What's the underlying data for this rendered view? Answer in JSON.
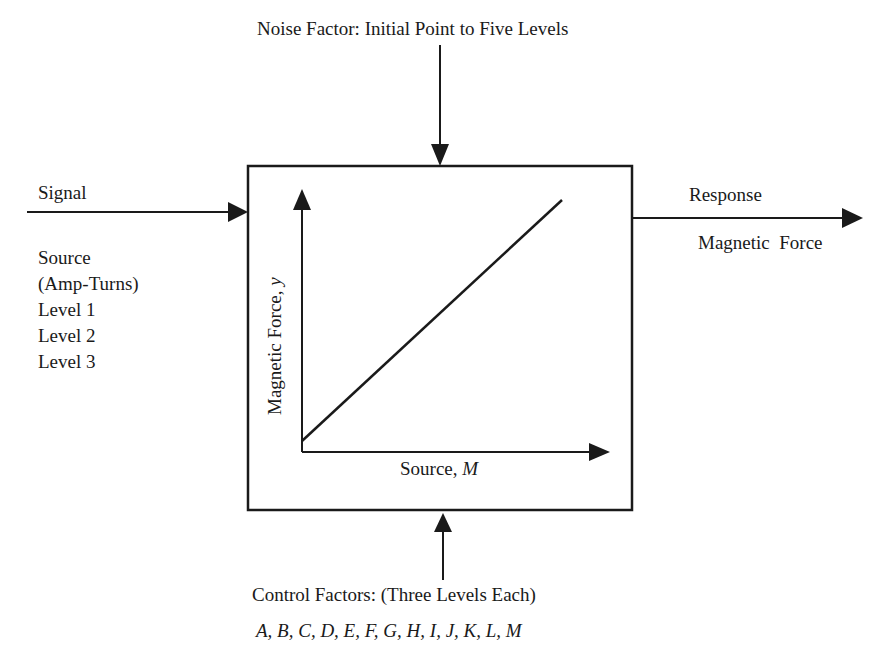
{
  "diagram": {
    "noise_factor": "Noise Factor: Initial Point to Five Levels",
    "signal": {
      "title": "Signal",
      "lines": [
        "Source",
        "(Amp-Turns)",
        "Level 1",
        "Level 2",
        "Level 3"
      ]
    },
    "response": {
      "title": "Response",
      "subtitle": "Magnetic  Force"
    },
    "control_factors": {
      "title": "Control Factors: (Three Levels Each)",
      "factors": "A, B, C, D, E, F, G, H, I, J, K, L, M"
    },
    "inner_plot": {
      "y_label_text": "Magnetic Force, ",
      "y_label_var": "y",
      "x_label_text": "Source, ",
      "x_label_var": "M"
    },
    "colors": {
      "stroke": "#1a1a1a",
      "background": "#ffffff"
    }
  }
}
